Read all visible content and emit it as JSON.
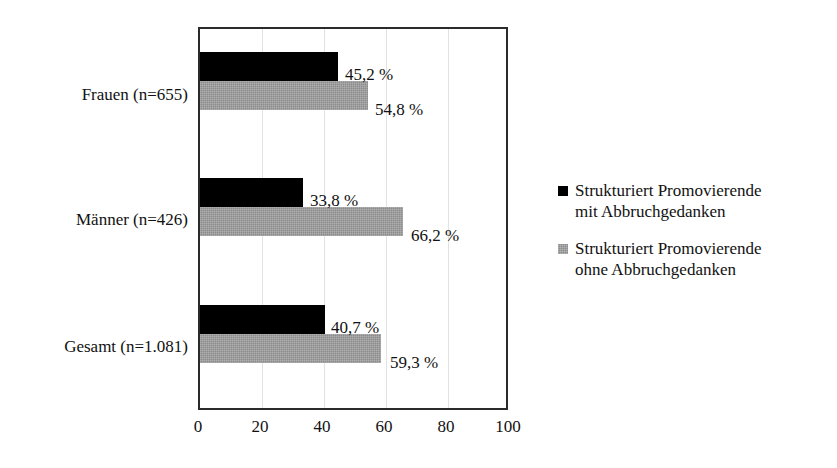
{
  "chart_data": {
    "type": "bar",
    "orientation": "horizontal",
    "title": "",
    "subtitle": "",
    "xlabel": "",
    "ylabel": "",
    "categories": [
      "Frauen (n=655)",
      "Männer (n=426)",
      "Gesamt (n=1.081)"
    ],
    "series": [
      {
        "name": "Strukturiert Promovierende mit Abbruchgedanken",
        "color": "#000000",
        "values": [
          45.2,
          33.8,
          40.7
        ],
        "value_labels": [
          "45,2 %",
          "33,8 %",
          "40,7 %"
        ]
      },
      {
        "name": "Strukturiert Promovierende ohne Abbruchgedanken",
        "color": "#8c8c8c",
        "values": [
          54.8,
          66.2,
          59.3
        ],
        "value_labels": [
          "54,8 %",
          "66,2 %",
          "59,3 %"
        ]
      }
    ],
    "xlim": [
      0,
      100
    ],
    "xticks": [
      0,
      20,
      40,
      60,
      80,
      100
    ],
    "xtick_labels": [
      "0",
      "20",
      "40",
      "60",
      "80",
      "100"
    ],
    "grid": "vertical",
    "legend_position": "right"
  },
  "axis": {
    "ticks": [
      {
        "label": "0",
        "value": 0
      },
      {
        "label": "20",
        "value": 20
      },
      {
        "label": "40",
        "value": 40
      },
      {
        "label": "60",
        "value": 60
      },
      {
        "label": "80",
        "value": 80
      },
      {
        "label": "100",
        "value": 100
      }
    ]
  },
  "categories": [
    {
      "label": "Frauen (n=655)",
      "black": {
        "value": 45.2,
        "label": "45,2 %"
      },
      "gray": {
        "value": 54.8,
        "label": "54,8 %"
      }
    },
    {
      "label": "Männer (n=426)",
      "black": {
        "value": 33.8,
        "label": "33,8 %"
      },
      "gray": {
        "value": 66.2,
        "label": "66,2 %"
      }
    },
    {
      "label": "Gesamt (n=1.081)",
      "black": {
        "value": 40.7,
        "label": "40,7 %"
      },
      "gray": {
        "value": 59.3,
        "label": "59,3 %"
      }
    }
  ],
  "legend": [
    {
      "marker": "black-square-marker",
      "color": "#000000",
      "line1": "Strukturiert Promovierende",
      "line2": "mit Abbruchgedanken"
    },
    {
      "marker": "gray-square-marker",
      "color": "#8c8c8c",
      "line1": "Strukturiert Promovierende",
      "line2": "ohne Abbruchgedanken"
    }
  ]
}
